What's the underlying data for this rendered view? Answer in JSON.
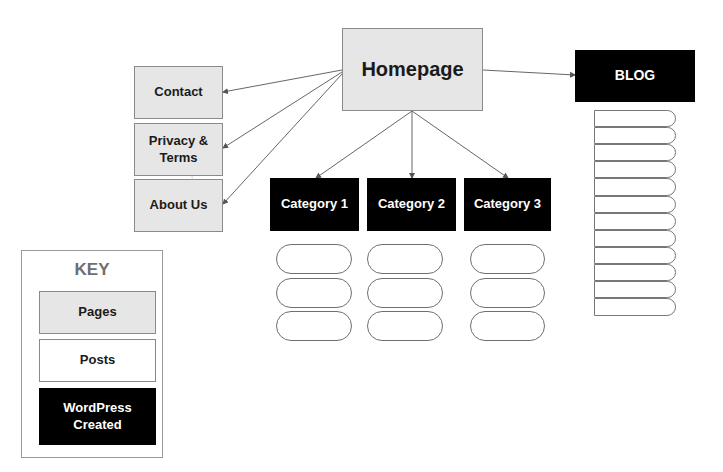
{
  "diagram": {
    "homepage": {
      "label": "Homepage"
    },
    "pages": [
      {
        "label": "Contact"
      },
      {
        "label": "Privacy & Terms"
      },
      {
        "label": "About Us"
      }
    ],
    "categories": [
      {
        "label": "Category 1",
        "post_count": 3
      },
      {
        "label": "Category 2",
        "post_count": 3
      },
      {
        "label": "Category 3",
        "post_count": 3
      }
    ],
    "blog": {
      "label": "BLOG",
      "post_count": 12
    },
    "key": {
      "title": "KEY",
      "items": [
        {
          "label": "Pages",
          "type": "page",
          "color": "#e6e6e6"
        },
        {
          "label": "Posts",
          "type": "post",
          "color": "#ffffff"
        },
        {
          "label": "WordPress Created",
          "type": "wp",
          "color": "#000000"
        }
      ]
    },
    "edges": [
      {
        "from": "Homepage",
        "to": "Contact"
      },
      {
        "from": "Homepage",
        "to": "Privacy & Terms"
      },
      {
        "from": "Homepage",
        "to": "About Us"
      },
      {
        "from": "Homepage",
        "to": "BLOG"
      },
      {
        "from": "Homepage",
        "to": "Category 1"
      },
      {
        "from": "Homepage",
        "to": "Category 2"
      },
      {
        "from": "Homepage",
        "to": "Category 3"
      }
    ],
    "colors": {
      "page": "#e6e6e6",
      "post": "#ffffff",
      "wp": "#000000",
      "line": "#555555"
    }
  }
}
